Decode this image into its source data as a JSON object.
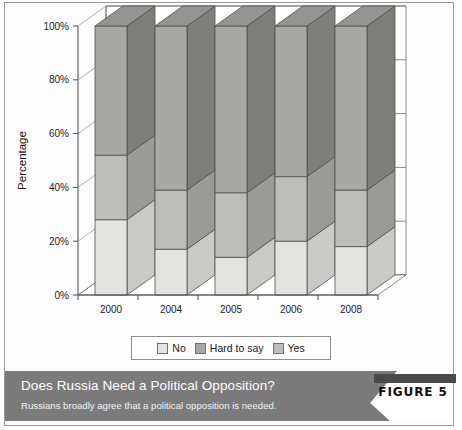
{
  "figure": {
    "badge_label": "FIGURE 5",
    "title": "Does Russia Need a Political Opposition?",
    "subtitle": "Russians broadly agree that a political opposition is needed.",
    "band_color": "#7b7b7b",
    "badge_bar_color": "#4a4a4a"
  },
  "legend": {
    "items": [
      {
        "label": "No",
        "color": "#e3e3e1"
      },
      {
        "label": "Hard to say",
        "color": "#a8a8a6"
      },
      {
        "label": "Yes",
        "color": "#bdbdbb"
      }
    ]
  },
  "chart_data": {
    "type": "bar",
    "subtype": "stacked-column-3d",
    "title": "Does Russia Need a Political Opposition?",
    "xlabel": "",
    "ylabel": "Percentage",
    "ylim": [
      0,
      100
    ],
    "yticks": [
      "0%",
      "20%",
      "40%",
      "60%",
      "80%",
      "100%"
    ],
    "ytick_values": [
      0,
      20,
      40,
      60,
      80,
      100
    ],
    "grid": true,
    "legend_position": "bottom",
    "categories": [
      "2000",
      "2004",
      "2005",
      "2006",
      "2008"
    ],
    "series": [
      {
        "name": "No",
        "color": "#e3e3e1",
        "side_color": "#c9c9c7",
        "top_color": "#d4d4d2",
        "values": [
          28,
          17,
          14,
          20,
          18
        ]
      },
      {
        "name": "Hard to say",
        "color": "#bdbdbb",
        "side_color": "#9a9a98",
        "top_color": "#aeaeac",
        "values": [
          24,
          22,
          24,
          24,
          21
        ]
      },
      {
        "name": "Yes",
        "color": "#a8a8a6",
        "side_color": "#7e7e7c",
        "top_color": "#949492",
        "values": [
          48,
          61,
          62,
          56,
          61
        ]
      }
    ]
  }
}
